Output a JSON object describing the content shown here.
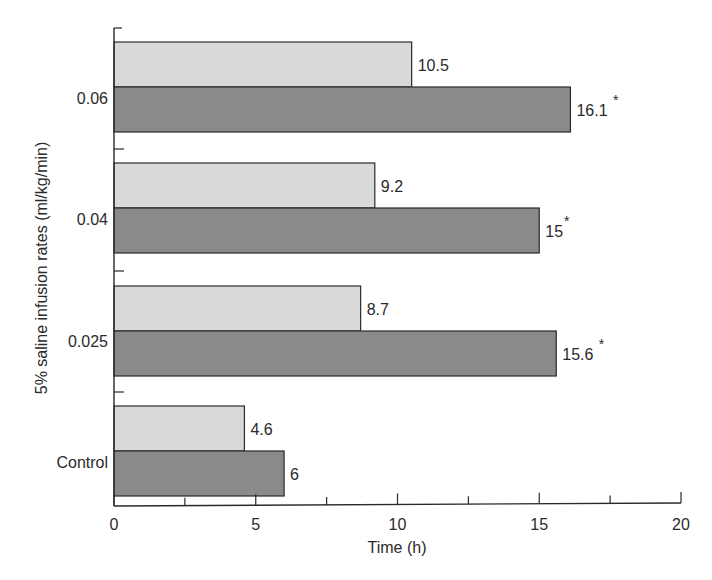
{
  "chart_data": {
    "type": "bar",
    "orientation": "horizontal",
    "title": "",
    "xlabel": "Time (h)",
    "ylabel": "5% saline infusion rates (ml/kg/min)",
    "xlim": [
      0,
      20
    ],
    "x_ticks": [
      "0",
      "5",
      "10",
      "15",
      "20"
    ],
    "x_minor_ticks": [
      2.5,
      7.5,
      12.5,
      17.5
    ],
    "grid": false,
    "legend": null,
    "categories": [
      "0.06",
      "0.04",
      "0.025",
      "Control"
    ],
    "series": [
      {
        "name": "light",
        "color": "#d9d9d9",
        "values": [
          10.5,
          9.2,
          8.7,
          4.6
        ],
        "labels": [
          "10.5",
          "9.2",
          "8.7",
          "4.6"
        ],
        "significant": [
          false,
          false,
          false,
          false
        ]
      },
      {
        "name": "dark",
        "color": "#8a8a8a",
        "values": [
          16.1,
          15,
          15.6,
          6
        ],
        "labels": [
          "16.1",
          "15",
          "15.6",
          "6"
        ],
        "significant": [
          true,
          true,
          true,
          false
        ]
      }
    ],
    "annotation_marker": "*"
  }
}
